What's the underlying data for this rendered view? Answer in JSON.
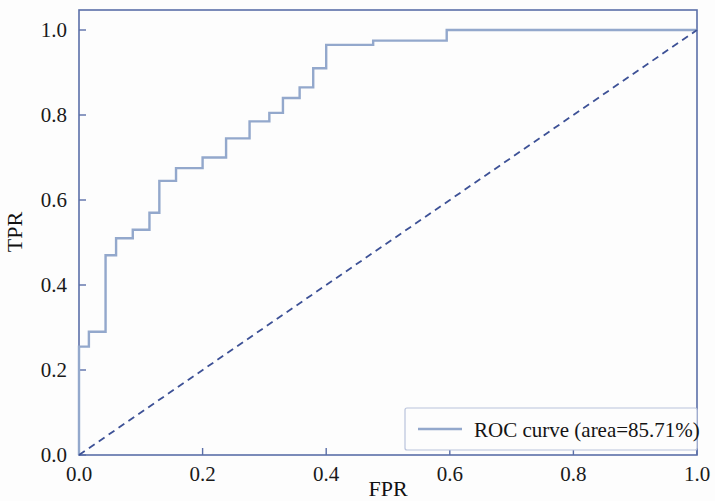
{
  "chart_data": {
    "type": "line",
    "title": "",
    "xlabel": "FPR",
    "ylabel": "TPR",
    "xlim": [
      0.0,
      1.0
    ],
    "ylim": [
      0.0,
      1.0
    ],
    "xticks": [
      "0.0",
      "0.2",
      "0.4",
      "0.6",
      "0.8",
      "1.0"
    ],
    "xtick_values": [
      0.0,
      0.2,
      0.4,
      0.6,
      0.8,
      1.0
    ],
    "yticks": [
      "0.0",
      "0.2",
      "0.4",
      "0.6",
      "0.8",
      "1.0"
    ],
    "ytick_values": [
      0.0,
      0.2,
      0.4,
      0.6,
      0.8,
      1.0
    ],
    "grid": false,
    "legend_position": "lower right",
    "auc_percent": "85.71",
    "series": [
      {
        "name": "ROC curve (area=85.71%)",
        "kind": "roc-step",
        "color": "#93a8cc",
        "linestyle": "solid",
        "linewidth": 2.4,
        "x": [
          0.0,
          0.0,
          0.016,
          0.016,
          0.043,
          0.043,
          0.06,
          0.06,
          0.087,
          0.087,
          0.114,
          0.114,
          0.13,
          0.13,
          0.157,
          0.157,
          0.2,
          0.2,
          0.238,
          0.238,
          0.276,
          0.276,
          0.308,
          0.308,
          0.33,
          0.33,
          0.357,
          0.357,
          0.379,
          0.379,
          0.4,
          0.4,
          0.476,
          0.476,
          0.595,
          0.595,
          1.0
        ],
        "y": [
          0.0,
          0.255,
          0.255,
          0.29,
          0.29,
          0.47,
          0.47,
          0.51,
          0.51,
          0.53,
          0.53,
          0.57,
          0.57,
          0.645,
          0.645,
          0.675,
          0.675,
          0.7,
          0.7,
          0.745,
          0.745,
          0.785,
          0.785,
          0.805,
          0.805,
          0.84,
          0.84,
          0.865,
          0.865,
          0.91,
          0.91,
          0.965,
          0.965,
          0.975,
          0.975,
          1.0,
          1.0
        ]
      },
      {
        "name": "chance-diagonal",
        "kind": "reference-diagonal",
        "color": "#3d5196",
        "linestyle": "dashed",
        "linewidth": 1.8,
        "x": [
          0.0,
          1.0
        ],
        "y": [
          0.0,
          1.0
        ]
      }
    ]
  },
  "legend": {
    "entries": [
      {
        "label": "ROC curve (area=85.71%)",
        "color": "#93a8cc"
      }
    ]
  },
  "axes": {
    "x_title": "FPR",
    "y_title": "TPR"
  },
  "colors": {
    "roc_curve": "#93a8cc",
    "diagonal": "#3d5196",
    "frame": "#5b6fa8",
    "text": "#141414",
    "background": "#fdfdfd"
  }
}
